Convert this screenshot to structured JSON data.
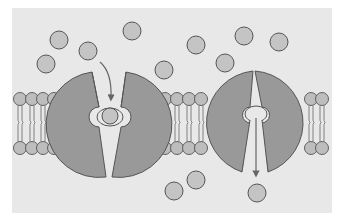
{
  "diagram": {
    "type": "carrier-protein-transport",
    "colors": {
      "page_bg": "#ffffff",
      "panel_bg": "#e8e8e8",
      "protein_fill": "#999999",
      "protein_stroke": "#555555",
      "molecule_fill": "#c4c4c4",
      "molecule_stroke": "#555555",
      "lipid_head_fill": "#bdbdbd",
      "lipid_tail": "#666666",
      "arrow": "#666666",
      "channel_fill": "#e8e8e8"
    },
    "panel": {
      "x": 12,
      "y": 8,
      "w": 320,
      "h": 205
    },
    "membrane": {
      "top_heads_y": 99,
      "bottom_heads_y": 148,
      "head_r": 6.5
    },
    "lipid_groups": [
      {
        "name": "left",
        "xs": [
          20,
          32,
          43,
          54
        ]
      },
      {
        "name": "middle",
        "xs": [
          165,
          177,
          189,
          201
        ]
      },
      {
        "name": "right",
        "xs": [
          311,
          322
        ]
      }
    ],
    "proteins": [
      {
        "name": "carrier-protein-open-outside",
        "cx": 109,
        "cy": 125,
        "r": 52,
        "state": "open to exterior, solute bound"
      },
      {
        "name": "carrier-protein-open-inside",
        "cx": 256,
        "cy": 122,
        "r": 52,
        "state": "open to interior, releasing solute"
      }
    ],
    "molecules": [
      {
        "cx": 59,
        "cy": 40
      },
      {
        "cx": 46,
        "cy": 64
      },
      {
        "cx": 88,
        "cy": 51
      },
      {
        "cx": 132,
        "cy": 31
      },
      {
        "cx": 164,
        "cy": 70
      },
      {
        "cx": 196,
        "cy": 45
      },
      {
        "cx": 244,
        "cy": 36
      },
      {
        "cx": 279,
        "cy": 42
      },
      {
        "cx": 225,
        "cy": 63
      },
      {
        "cx": 110,
        "cy": 115,
        "bound": true
      },
      {
        "cx": 174,
        "cy": 191
      },
      {
        "cx": 196,
        "cy": 180
      },
      {
        "cx": 257,
        "cy": 193
      }
    ],
    "molecule_r": 9,
    "arrows": [
      {
        "name": "solute-entry-arrow",
        "direction": "down into left carrier"
      },
      {
        "name": "solute-release-arrow",
        "direction": "down out of right carrier"
      }
    ]
  }
}
